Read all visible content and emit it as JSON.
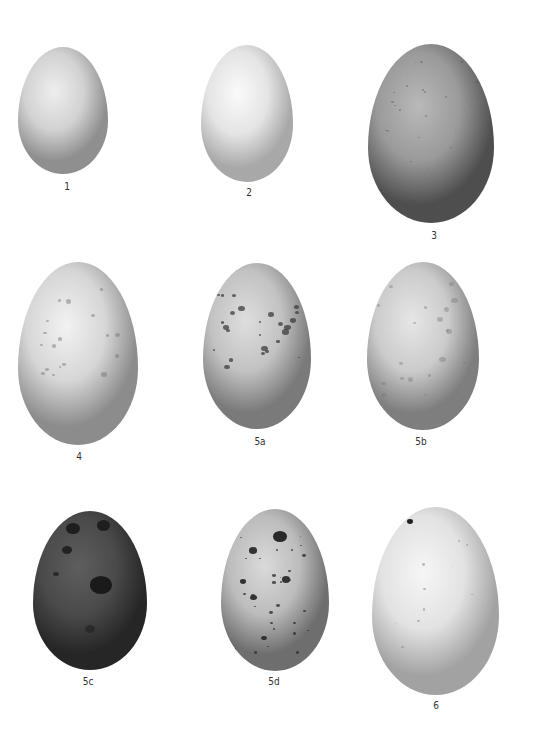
{
  "plate": {
    "eggs": [
      {
        "id": "1",
        "label": "1",
        "x": 18,
        "y": 47,
        "w": 90,
        "h": 127,
        "base": "#d2d2d2",
        "light": "#eeeeee",
        "dark": "#8f8f8f",
        "markings": "none"
      },
      {
        "id": "2",
        "label": "2",
        "x": 201,
        "y": 45,
        "w": 92,
        "h": 137,
        "base": "#e4e4e4",
        "light": "#fafafa",
        "dark": "#a8a8a8",
        "markings": "none"
      },
      {
        "id": "3",
        "label": "3",
        "x": 368,
        "y": 44,
        "w": 126,
        "h": 179,
        "base": "#9a9a9a",
        "light": "#b9b9b9",
        "dark": "#4e4e4e",
        "markings": "fine-speckle"
      },
      {
        "id": "4",
        "label": "4",
        "x": 18,
        "y": 262,
        "w": 120,
        "h": 183,
        "base": "#d6d6d6",
        "light": "#f2f2f2",
        "dark": "#8c8c8c",
        "markings": "light-spots"
      },
      {
        "id": "5a",
        "label": "5a",
        "x": 203,
        "y": 263,
        "w": 108,
        "h": 166,
        "base": "#c2c2c2",
        "light": "#dedede",
        "dark": "#7a7a7a",
        "markings": "dark-band-spots"
      },
      {
        "id": "5b",
        "label": "5b",
        "x": 367,
        "y": 262,
        "w": 112,
        "h": 168,
        "base": "#cbcbcb",
        "light": "#e6e6e6",
        "dark": "#7e7e7e",
        "markings": "faint-scrawls"
      },
      {
        "id": "5c",
        "label": "5c",
        "x": 33,
        "y": 511,
        "w": 114,
        "h": 159,
        "base": "#4a4a4a",
        "light": "#5e5e5e",
        "dark": "#262626",
        "markings": "dark-blotches"
      },
      {
        "id": "5d",
        "label": "5d",
        "x": 221,
        "y": 509,
        "w": 108,
        "h": 162,
        "base": "#bcbcbc",
        "light": "#dadada",
        "dark": "#6e6e6e",
        "markings": "heavy-blotches"
      },
      {
        "id": "6",
        "label": "6",
        "x": 372,
        "y": 507,
        "w": 127,
        "h": 188,
        "base": "#e2e2e2",
        "light": "#f6f6f6",
        "dark": "#a2a2a2",
        "markings": "hairline-scrawls"
      }
    ],
    "labels": [
      {
        "text": "1",
        "x": 67,
        "y": 181
      },
      {
        "text": "2",
        "x": 249,
        "y": 187
      },
      {
        "text": "3",
        "x": 434,
        "y": 230
      },
      {
        "text": "4",
        "x": 79,
        "y": 451
      },
      {
        "text": "5a",
        "x": 260,
        "y": 436
      },
      {
        "text": "5b",
        "x": 421,
        "y": 436
      },
      {
        "text": "5c",
        "x": 88,
        "y": 676
      },
      {
        "text": "5d",
        "x": 274,
        "y": 676
      },
      {
        "text": "6",
        "x": 436,
        "y": 700
      }
    ]
  }
}
